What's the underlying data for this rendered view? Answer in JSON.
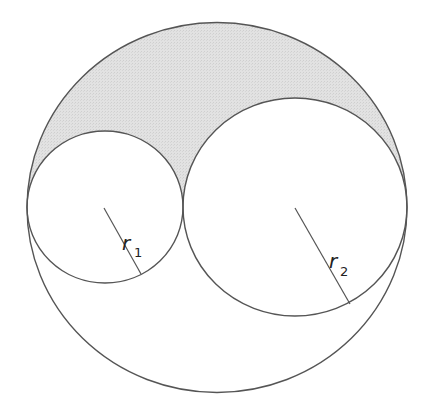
{
  "diagram": {
    "colors": {
      "stroke": "#555555",
      "shade": "#dcdcdc",
      "background": "#ffffff"
    },
    "outer_circle": {
      "cx": 217,
      "cy": 207.5,
      "rx": 190,
      "ry": 185
    },
    "small_circle": {
      "cx": 105,
      "cy": 207,
      "rx": 78,
      "ry": 76
    },
    "large_circle": {
      "cx": 295,
      "cy": 207,
      "rx": 112,
      "ry": 109
    },
    "radius_1": {
      "label": "r",
      "subscript": "1",
      "from": [
        104,
        208
      ],
      "to": [
        141,
        274
      ]
    },
    "radius_2": {
      "label": "r",
      "subscript": "2",
      "from": [
        295,
        208
      ],
      "to": [
        350,
        304
      ]
    }
  }
}
